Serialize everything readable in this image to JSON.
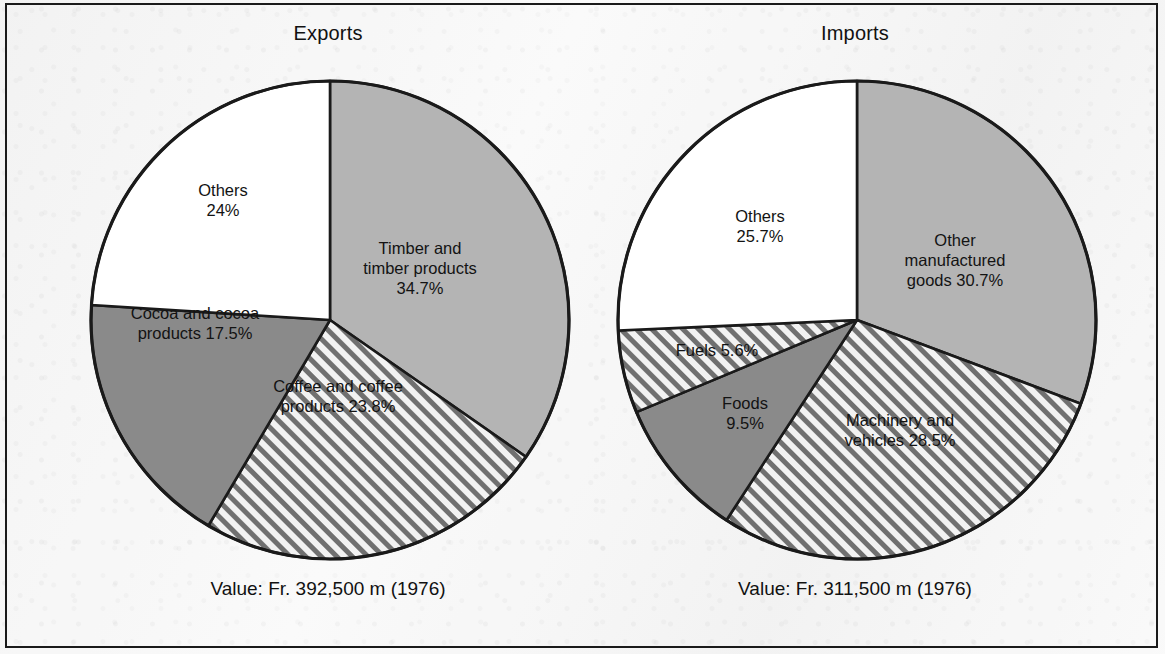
{
  "figure": {
    "background_color": "#f7f7f7",
    "frame_color": "#1a1a1a",
    "outline_color": "#1a1a1a"
  },
  "palette": {
    "light_gray": "#b4b4b4",
    "dark_gray": "#8a8a8a",
    "white": "#ffffff",
    "hatch_line": "#6f6f6f",
    "hatch_bg": "#f2f2f2",
    "text": "#131313"
  },
  "charts": [
    {
      "id": "exports",
      "title": "Exports",
      "caption": "Value: Fr. 392,500 m (1976)",
      "slices": [
        {
          "label": "Timber and\ntimber products\n34.7%",
          "name": "Timber and timber products",
          "value": 34.7,
          "fill": "light_gray",
          "label_x": 332,
          "label_y": 190
        },
        {
          "label": "Coffee and coffee\nproducts 23.8%",
          "name": "Coffee and coffee products",
          "value": 23.8,
          "fill": "hatch",
          "label_x": 250,
          "label_y": 318
        },
        {
          "label": "Cocoa and cocoa\nproducts 17.5%",
          "name": "Cocoa and cocoa products",
          "value": 17.5,
          "fill": "dark_gray",
          "label_x": 107,
          "label_y": 245
        },
        {
          "label": "Others\n24%",
          "name": "Others",
          "value": 24.0,
          "fill": "white",
          "label_x": 135,
          "label_y": 122
        }
      ]
    },
    {
      "id": "imports",
      "title": "Imports",
      "caption": "Value: Fr. 311,500 m (1976)",
      "slices": [
        {
          "label": "Other manufactured\ngoods 30.7%",
          "name": "Other manufactured goods",
          "value": 30.7,
          "fill": "light_gray",
          "label_x": 340,
          "label_y": 182
        },
        {
          "label": "Machinery and\nvehicles 28.5%",
          "name": "Machinery and vehicles",
          "value": 28.5,
          "fill": "hatch",
          "label_x": 285,
          "label_y": 352
        },
        {
          "label": "Foods\n9.5%",
          "name": "Foods",
          "value": 9.5,
          "fill": "dark_gray",
          "label_x": 130,
          "label_y": 335
        },
        {
          "label": "Fuels 5.6%",
          "name": "Fuels",
          "value": 5.6,
          "fill": "hatch",
          "label_x": 102,
          "label_y": 272
        },
        {
          "label": "Others\n25.7%",
          "name": "Others",
          "value": 25.7,
          "fill": "white",
          "label_x": 145,
          "label_y": 148
        }
      ]
    }
  ],
  "chart_data": [
    {
      "type": "pie",
      "title": "Exports",
      "subtitle": "Value: Fr. 392,500 m (1976)",
      "unit": "percent",
      "start_angle_deg": 0,
      "direction": "clockwise",
      "total_value": "Fr. 392,500 m",
      "year": 1976,
      "categories": [
        "Timber and timber products",
        "Coffee and coffee products",
        "Cocoa and cocoa products",
        "Others"
      ],
      "values": [
        34.7,
        23.8,
        17.5,
        24.0
      ],
      "labels": [
        "Timber and timber products 34.7%",
        "Coffee and coffee products 23.8%",
        "Cocoa and cocoa products 17.5%",
        "Others 24%"
      ],
      "fills": [
        "solid light gray",
        "diagonal hatch",
        "solid dark gray",
        "white"
      ],
      "legend": "none (labels inside slices)"
    },
    {
      "type": "pie",
      "title": "Imports",
      "subtitle": "Value: Fr. 311,500 m (1976)",
      "unit": "percent",
      "start_angle_deg": 0,
      "direction": "clockwise",
      "total_value": "Fr. 311,500 m",
      "year": 1976,
      "categories": [
        "Other manufactured goods",
        "Machinery and vehicles",
        "Foods",
        "Fuels",
        "Others"
      ],
      "values": [
        30.7,
        28.5,
        9.5,
        5.6,
        25.7
      ],
      "labels": [
        "Other manufactured goods 30.7%",
        "Machinery and vehicles 28.5%",
        "Foods 9.5%",
        "Fuels 5.6%",
        "Others 25.7%"
      ],
      "fills": [
        "solid light gray",
        "diagonal hatch",
        "solid dark gray",
        "diagonal hatch",
        "white"
      ],
      "legend": "none (labels inside slices)"
    }
  ]
}
